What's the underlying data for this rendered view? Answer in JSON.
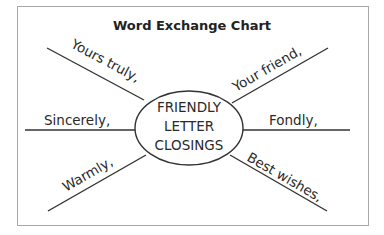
{
  "chart": {
    "title": "Word Exchange Chart",
    "center": {
      "lines": [
        "FRIENDLY",
        "LETTER",
        "CLOSINGS"
      ]
    },
    "spokes": {
      "top_left": "Yours truly,",
      "top_right": "Your friend,",
      "left": "Sincerely,",
      "right": "Fondly,",
      "bottom_left": "Warmly,",
      "bottom_right": "Best wishes,"
    }
  },
  "colors": {
    "line": "#333333",
    "border": "#aaaaaa",
    "text": "#2a2a2a"
  }
}
